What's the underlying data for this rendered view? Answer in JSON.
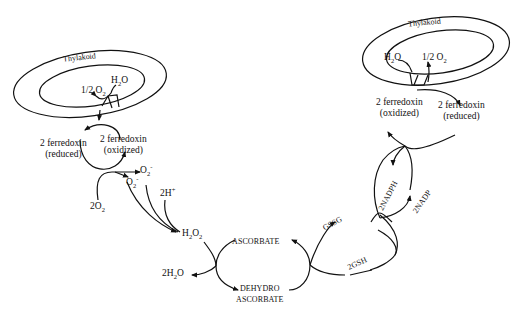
{
  "diagram": {
    "left_thylakoid": {
      "label": "Thylakoid",
      "inner_products": {
        "h2o": "H2O",
        "half_o2": "1/2 O2"
      },
      "ferredoxin_reduced": {
        "line1": "2 ferredoxin",
        "line2": "(reduced)"
      },
      "ferredoxin_oxidized": {
        "line1": "2 ferredoxin",
        "line2": "(oxidized)"
      }
    },
    "superoxide_branch": {
      "o2_in": "2O2",
      "superoxide_out": "O2-",
      "superoxide": "O2-",
      "protons": "2H+"
    },
    "ascorbate_cycle": {
      "h2o2": "H2O2",
      "water": "2H2O",
      "ascorbate": "ASCORBATE",
      "dehydro_line1": "DEHYDRO",
      "dehydro_line2": "ASCORBATE"
    },
    "glutathione_cycle": {
      "gssg": "GSSG",
      "gsh": "2GSH"
    },
    "nadp_cycle": {
      "nadph": "2NADPH",
      "nadp": "2NADP"
    },
    "right_thylakoid": {
      "label": "Thylakoid",
      "inner_products": {
        "h2o": "H2O",
        "half_o2": "1/2 O2"
      },
      "ferredoxin_oxidized": {
        "line1": "2 ferredoxin",
        "line2": "(oxidized)"
      },
      "ferredoxin_reduced": {
        "line1": "2 ferredoxin",
        "line2": "(reduced)"
      }
    },
    "caption_partial": "Fig. The ascorbate-glutathione cycle in chloroplasts (text truncated)"
  },
  "colors": {
    "ink": "#111111",
    "background": "#ffffff"
  }
}
